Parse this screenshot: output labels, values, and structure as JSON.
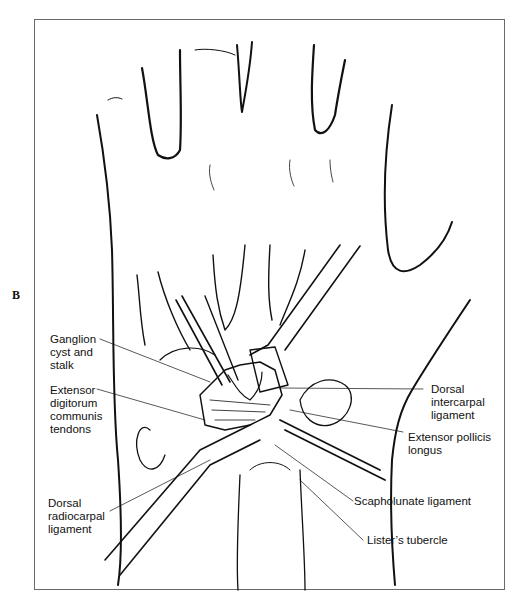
{
  "figure": {
    "panel_letter": "B",
    "line_color": "#111111",
    "frame_color": "#6a6a6a"
  },
  "labels": {
    "ganglion": "Ganglion\ncyst and\nstalk",
    "edc": "Extensor\ndigitorum\ncommunis\ntendons",
    "drc": "Dorsal\nradiocarpal\nligament",
    "dic": "Dorsal\nintercarpal\nligament",
    "epl": "Extensor pollicis\nlongus",
    "sl": "Scapholunate ligament",
    "lister": "Lister’s tubercle"
  }
}
